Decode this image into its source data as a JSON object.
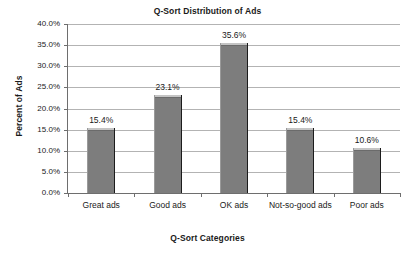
{
  "chart_data": {
    "type": "bar",
    "title": "Q-Sort Distribution of Ads",
    "xlabel": "Q-Sort Categories",
    "ylabel": "Percent of Ads",
    "categories": [
      "Great ads",
      "Good ads",
      "OK ads",
      "Not-so-good ads",
      "Poor ads"
    ],
    "values": [
      15.4,
      23.1,
      35.6,
      15.4,
      10.6
    ],
    "data_labels": [
      "15.4%",
      "23.1%",
      "35.6%",
      "15.4%",
      "10.6%"
    ],
    "ylim": [
      0,
      40
    ],
    "ytick_values": [
      40.0,
      35.0,
      30.0,
      25.0,
      20.0,
      15.0,
      10.0,
      5.0,
      0.0
    ],
    "ytick_labels": [
      "40.0%",
      "35.0%",
      "30.0%",
      "25.0%",
      "20.0%",
      "15.0%",
      "10.0%",
      "5.0%",
      "0.0%"
    ],
    "grid": true,
    "legend": false,
    "series_color": "#7d7d7d",
    "gridline_color": "#b3b3b3",
    "axis_color": "#6e6e6e",
    "text_color": "#1a1a1a",
    "background": "#ffffff"
  }
}
